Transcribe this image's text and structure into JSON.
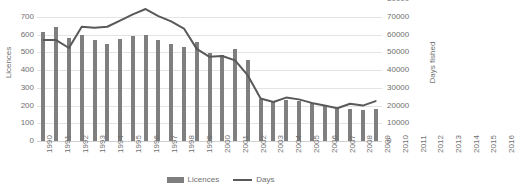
{
  "chart_data": {
    "type": "bar",
    "title": "",
    "xlabel": "",
    "ylabel": "Licences",
    "y2label": "Days fished",
    "categories": [
      "1990",
      "1991",
      "1992",
      "1993",
      "1994",
      "1995",
      "1996",
      "1997",
      "1998",
      "1999",
      "2000",
      "2001",
      "2002",
      "2003",
      "2004",
      "2005",
      "2006",
      "2007",
      "2008",
      "2009",
      "2010",
      "2011",
      "2012",
      "2013",
      "2014",
      "2015",
      "2016"
    ],
    "ylim": [
      0,
      700
    ],
    "yticks": [
      "0",
      "100",
      "200",
      "300",
      "400",
      "500",
      "600",
      "700"
    ],
    "y2lim": [
      0,
      80000
    ],
    "y2ticks": [
      "0",
      "10000",
      "20000",
      "30000",
      "40000",
      "50000",
      "60000",
      "70000",
      "80000"
    ],
    "grid": true,
    "legend_position": "bottom",
    "series": [
      {
        "name": "Licences",
        "type": "bar",
        "axis": "left",
        "color": "#7f7f7f",
        "values": [
          615,
          645,
          580,
          597,
          570,
          548,
          575,
          593,
          598,
          572,
          545,
          530,
          558,
          495,
          483,
          520,
          460,
          238,
          222,
          230,
          225,
          215,
          205,
          178,
          182,
          175,
          180
        ]
      },
      {
        "name": "Days",
        "type": "line",
        "axis": "right",
        "color": "#595959",
        "values": [
          57000,
          57000,
          52500,
          64500,
          64000,
          64500,
          68000,
          71500,
          74500,
          70500,
          67500,
          63500,
          52000,
          47500,
          48000,
          45500,
          37000,
          24000,
          22000,
          24500,
          23500,
          21500,
          20000,
          18500,
          21000,
          20000,
          22500
        ]
      }
    ]
  },
  "legend": {
    "items": [
      {
        "label": "Licences",
        "marker": "bar-swatch"
      },
      {
        "label": "Days",
        "marker": "line-swatch"
      }
    ]
  },
  "colors": {
    "bar": "#7f7f7f",
    "line": "#595959",
    "gridline": "#e4e4e4",
    "tick_text": "#6f6f6f",
    "background": "#ffffff"
  }
}
